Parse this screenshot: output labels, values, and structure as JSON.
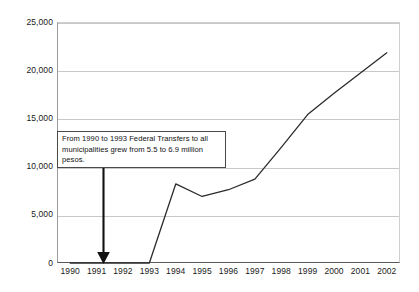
{
  "chart_data": {
    "type": "line",
    "title": "",
    "xlabel": "",
    "ylabel": "",
    "categories": [
      "1990",
      "1991",
      "1992",
      "1993",
      "1994",
      "1995",
      "1996",
      "1997",
      "1998",
      "1999",
      "2000",
      "2001",
      "2002"
    ],
    "series": [
      {
        "name": "Federal Transfers",
        "values": [
          0,
          0,
          0,
          0,
          8200,
          6900,
          7600,
          8700,
          12000,
          15400,
          17600,
          19700,
          21800
        ]
      }
    ],
    "ylim": [
      0,
      25000
    ],
    "ytick_labels": [
      "0",
      "5,000",
      "10,000",
      "15,000",
      "20,000",
      "25,000"
    ],
    "ytick_values": [
      0,
      5000,
      10000,
      15000,
      20000,
      25000
    ],
    "grid": "horizontal",
    "legend": "none",
    "line_color": "#2b2b2b",
    "grid_color": "#c8c8c8",
    "background_color": "#ffffff",
    "annotations": [
      {
        "name": "federal-transfers-note",
        "text": "From 1990 to 1993 Federal Transfers to all municipalities grew from 5.5 to 6.9 million pesos.",
        "arrow": {
          "points_to_category": "1991",
          "direction": "down"
        }
      }
    ]
  }
}
